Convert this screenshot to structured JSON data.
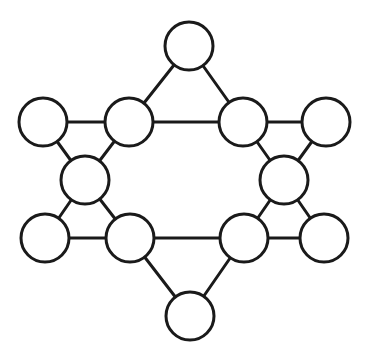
{
  "diagram": {
    "type": "graph",
    "style": {
      "stroke_color": "#1a1a1a",
      "fill_color": "#ffffff",
      "background": "#ffffff",
      "node_radius": 24,
      "stroke_width": 3
    },
    "nodes": [
      {
        "id": "top",
        "x": 189,
        "y": 46,
        "label": ""
      },
      {
        "id": "upper-left-outer",
        "x": 43,
        "y": 122,
        "label": ""
      },
      {
        "id": "upper-left-inner",
        "x": 129,
        "y": 122,
        "label": ""
      },
      {
        "id": "upper-right-inner",
        "x": 243,
        "y": 122,
        "label": ""
      },
      {
        "id": "upper-right-outer",
        "x": 326,
        "y": 122,
        "label": ""
      },
      {
        "id": "middle-left",
        "x": 85,
        "y": 180,
        "label": ""
      },
      {
        "id": "middle-right",
        "x": 284,
        "y": 180,
        "label": ""
      },
      {
        "id": "lower-left-outer",
        "x": 45,
        "y": 238,
        "label": ""
      },
      {
        "id": "lower-left-inner",
        "x": 130,
        "y": 238,
        "label": ""
      },
      {
        "id": "lower-right-inner",
        "x": 244,
        "y": 238,
        "label": ""
      },
      {
        "id": "lower-right-outer",
        "x": 324,
        "y": 238,
        "label": ""
      },
      {
        "id": "bottom",
        "x": 190,
        "y": 316,
        "label": ""
      }
    ],
    "edges": [
      [
        "top",
        "upper-left-inner"
      ],
      [
        "top",
        "upper-right-inner"
      ],
      [
        "upper-left-outer",
        "upper-left-inner"
      ],
      [
        "upper-left-inner",
        "upper-right-inner"
      ],
      [
        "upper-right-inner",
        "upper-right-outer"
      ],
      [
        "upper-left-outer",
        "middle-left"
      ],
      [
        "upper-left-inner",
        "middle-left"
      ],
      [
        "upper-right-inner",
        "middle-right"
      ],
      [
        "upper-right-outer",
        "middle-right"
      ],
      [
        "middle-left",
        "lower-left-outer"
      ],
      [
        "middle-left",
        "lower-left-inner"
      ],
      [
        "middle-right",
        "lower-right-inner"
      ],
      [
        "middle-right",
        "lower-right-outer"
      ],
      [
        "lower-left-outer",
        "lower-left-inner"
      ],
      [
        "lower-left-inner",
        "lower-right-inner"
      ],
      [
        "lower-right-inner",
        "lower-right-outer"
      ],
      [
        "lower-left-inner",
        "bottom"
      ],
      [
        "lower-right-inner",
        "bottom"
      ]
    ]
  }
}
